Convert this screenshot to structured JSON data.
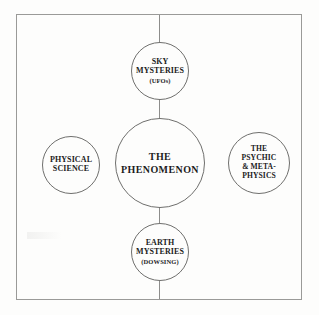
{
  "figure": {
    "title": "The Phenomenon",
    "type": "hub-and-spoke concept diagram",
    "frame": {
      "style": "thin rectangular border",
      "color": "#9a9a98"
    },
    "ink_color": "#1c1c1c",
    "line_color": "#8d8d8b"
  },
  "nodes": {
    "center": {
      "id": "the-phenomenon",
      "line1": "THE",
      "line2": "PHENOMENON",
      "position": "center"
    },
    "top": {
      "id": "sky-mysteries",
      "line1": "SKY",
      "line2": "MYSTERIES",
      "subtitle": "(UFOs)",
      "position": "top"
    },
    "bottom": {
      "id": "earth-mysteries",
      "line1": "EARTH",
      "line2": "MYSTERIES",
      "subtitle": "(DOWSING)",
      "position": "bottom"
    },
    "left": {
      "id": "physical-science",
      "line1": "PHYSICAL",
      "line2": "SCIENCE",
      "position": "left"
    },
    "right": {
      "id": "psychic-metaphysics",
      "line1": "THE",
      "line2": "PSYCHIC",
      "line3": "& META-",
      "line4": "PHYSICS",
      "position": "right"
    }
  }
}
